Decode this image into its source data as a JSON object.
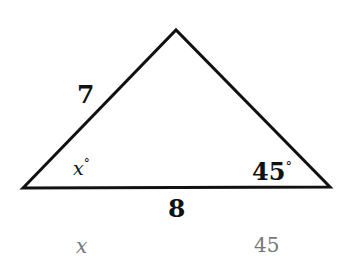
{
  "diagram": {
    "type": "triangle",
    "vertices": {
      "left": [
        23,
        188
      ],
      "apex": [
        176,
        30
      ],
      "right": [
        330,
        187
      ]
    },
    "side_labels": {
      "left_side": "7",
      "base": "8"
    },
    "angle_labels": {
      "left_angle": "x",
      "left_angle_degree": "°",
      "right_angle": "45",
      "right_angle_degree": "°"
    },
    "footer_labels": {
      "left": "x",
      "right": "45"
    },
    "colors": {
      "stroke": "#111111",
      "footer_text": "#777777"
    }
  }
}
